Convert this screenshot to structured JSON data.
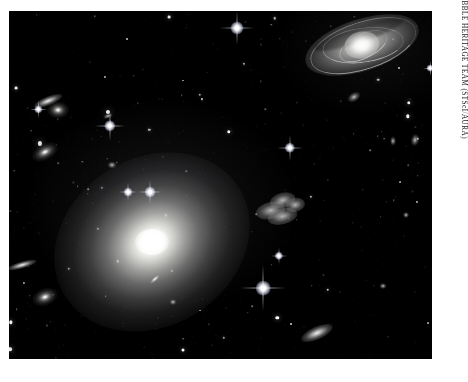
{
  "plate": {
    "background_color": "#ffffff",
    "photo": {
      "alt_name": "hubble-galaxy-cluster-photograph",
      "background_color": "#000000",
      "subject": "Galaxy cluster dominated by a giant elliptical galaxy",
      "bounds": {
        "left": 9,
        "top": 11,
        "width": 423,
        "height": 348
      }
    }
  },
  "credit": {
    "text": "NASA, ESA, AND THE HUBBLE HERITAGE TEAM (STScI/AURA)",
    "orientation": "vertical",
    "color": "#1a1a1a"
  },
  "objects": {
    "central_galaxy": {
      "label": "giant-elliptical-galaxy",
      "type": "elliptical",
      "center": [
        152,
        242
      ],
      "size": [
        205,
        168
      ],
      "rotation": -32,
      "core_size": [
        34,
        26
      ]
    },
    "spiral_galaxy": {
      "label": "inclined-barred-spiral-galaxy",
      "type": "spiral",
      "center": [
        362,
        45
      ],
      "size": [
        118,
        52
      ],
      "rotation": -18
    },
    "irregular_galaxy": {
      "label": "disturbed-irregular-galaxy",
      "type": "irregular",
      "center": [
        283,
        210
      ],
      "size": [
        54,
        34
      ],
      "rotation": -14
    },
    "companions": [
      {
        "label": "edge-on-lenticular-upper-left",
        "type": "sliver",
        "cx": 48,
        "cy": 101,
        "w": 30,
        "h": 9,
        "rot": -22
      },
      {
        "label": "bright-elliptical-upper-left",
        "type": "elliptical",
        "cx": 58,
        "cy": 110,
        "w": 22,
        "h": 17,
        "rot": 0
      },
      {
        "label": "elliptical-mid-left",
        "type": "elliptical",
        "cx": 45,
        "cy": 152,
        "w": 28,
        "h": 16,
        "rot": -28
      },
      {
        "label": "edge-on-lower-left",
        "type": "sliver",
        "cx": 22,
        "cy": 265,
        "w": 30,
        "h": 7,
        "rot": -16
      },
      {
        "label": "elliptical-lower-left",
        "type": "elliptical",
        "cx": 45,
        "cy": 297,
        "w": 26,
        "h": 17,
        "rot": -20
      },
      {
        "label": "elongated-galaxy-lower-right",
        "type": "sliver",
        "cx": 317,
        "cy": 333,
        "w": 34,
        "h": 13,
        "rot": -24
      },
      {
        "label": "fuzzy-galaxy-upper-right",
        "type": "fuzzy",
        "cx": 354,
        "cy": 97,
        "w": 14,
        "h": 9,
        "rot": -32
      },
      {
        "label": "fuzzy-galaxy-right-upper",
        "type": "fuzzy",
        "cx": 415,
        "cy": 140,
        "w": 8,
        "h": 12,
        "rot": 10
      },
      {
        "label": "fuzzy-galaxy-right-mid",
        "type": "fuzzy",
        "cx": 393,
        "cy": 141,
        "w": 6,
        "h": 9,
        "rot": 0
      },
      {
        "label": "fuzzy-galaxy-center-left",
        "type": "fuzzy",
        "cx": 112,
        "cy": 165,
        "w": 9,
        "h": 7,
        "rot": 0
      },
      {
        "label": "fuzzy-galaxy-center",
        "type": "fuzzy",
        "cx": 108,
        "cy": 116,
        "w": 10,
        "h": 5,
        "rot": -20
      },
      {
        "label": "fuzzy-galaxy-inner-disk",
        "type": "sliver",
        "cx": 155,
        "cy": 279,
        "w": 14,
        "h": 5,
        "rot": -42
      },
      {
        "label": "fuzzy-galaxy-lower-center",
        "type": "fuzzy",
        "cx": 173,
        "cy": 302,
        "w": 7,
        "h": 6,
        "rot": 0
      },
      {
        "label": "fuzzy-galaxy-far-right",
        "type": "fuzzy",
        "cx": 406,
        "cy": 215,
        "w": 6,
        "h": 6,
        "rot": 0
      },
      {
        "label": "fuzzy-galaxy-right-low",
        "type": "fuzzy",
        "cx": 383,
        "cy": 286,
        "w": 7,
        "h": 6,
        "rot": 0
      }
    ],
    "bright_stars": [
      {
        "label": "diffraction-star-top",
        "cx": 237,
        "cy": 28,
        "core": 5,
        "spike": 34
      },
      {
        "label": "diffraction-star-left",
        "cx": 110,
        "cy": 126,
        "core": 4.4,
        "spike": 30
      },
      {
        "label": "diffraction-star-upper-mid",
        "cx": 290,
        "cy": 148,
        "core": 4.0,
        "spike": 26
      },
      {
        "label": "diffraction-star-bright",
        "cx": 263,
        "cy": 288,
        "core": 5.6,
        "spike": 46
      },
      {
        "label": "diffraction-star-center",
        "cx": 150,
        "cy": 192,
        "core": 4.2,
        "spike": 24
      },
      {
        "label": "diffraction-star-inner",
        "cx": 128,
        "cy": 192,
        "core": 3.4,
        "spike": 18
      },
      {
        "label": "diffraction-star-mid-right",
        "cx": 279,
        "cy": 256,
        "core": 3.2,
        "spike": 16
      },
      {
        "label": "diffraction-star-far-right",
        "cx": 430,
        "cy": 68,
        "core": 3.0,
        "spike": 15
      },
      {
        "label": "diffraction-star-upper-left",
        "cx": 38,
        "cy": 109,
        "core": 3.2,
        "spike": 17
      }
    ],
    "field_star_count": 260
  }
}
